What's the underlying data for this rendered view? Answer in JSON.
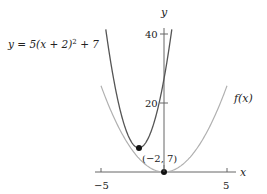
{
  "chart_data": {
    "type": "line",
    "title": "",
    "xlabel": "x",
    "ylabel": "y",
    "xlim": [
      -5.5,
      5.5
    ],
    "ylim": [
      0,
      42
    ],
    "x_ticks": [
      -5,
      5
    ],
    "x_tick_labels": [
      "−5",
      "5"
    ],
    "y_ticks": [
      20,
      40
    ],
    "y_tick_labels": [
      "20",
      "40"
    ],
    "grid": false,
    "series": [
      {
        "name": "f(x)",
        "formula": "x^2",
        "color": "#aaaaaa",
        "x": [
          -5,
          -4,
          -3,
          -2,
          -1,
          0,
          1,
          2,
          3,
          4,
          5
        ],
        "values": [
          25,
          16,
          9,
          4,
          1,
          0,
          1,
          4,
          9,
          16,
          25
        ]
      },
      {
        "name": "y = 5(x + 2)^2 + 7",
        "formula": "5(x+2)^2+7",
        "color": "#555555",
        "x": [
          -4.6,
          -4,
          -3,
          -2,
          -1,
          0,
          0.6
        ],
        "values": [
          40.8,
          27,
          12,
          7,
          12,
          27,
          40.8
        ]
      }
    ],
    "points": [
      {
        "x": -2,
        "y": 7,
        "label": "(−2, 7)"
      },
      {
        "x": 0,
        "y": 0,
        "label": ""
      }
    ],
    "annotations": [
      {
        "text": "y = 5(x + 2)² + 7",
        "target": "shifted parabola"
      },
      {
        "text": "f(x)",
        "target": "base parabola"
      },
      {
        "text": "(−2, 7)",
        "target": "vertex"
      }
    ]
  },
  "labels": {
    "equation_pre": "y = 5(x + 2)",
    "equation_sup": "2",
    "equation_post": " + 7",
    "fx": "f(x)",
    "vertex": "(−2, 7)",
    "x_axis": "x",
    "y_axis": "y",
    "tick_neg5": "−5",
    "tick_5": "5",
    "tick_20": "20",
    "tick_40": "40"
  }
}
